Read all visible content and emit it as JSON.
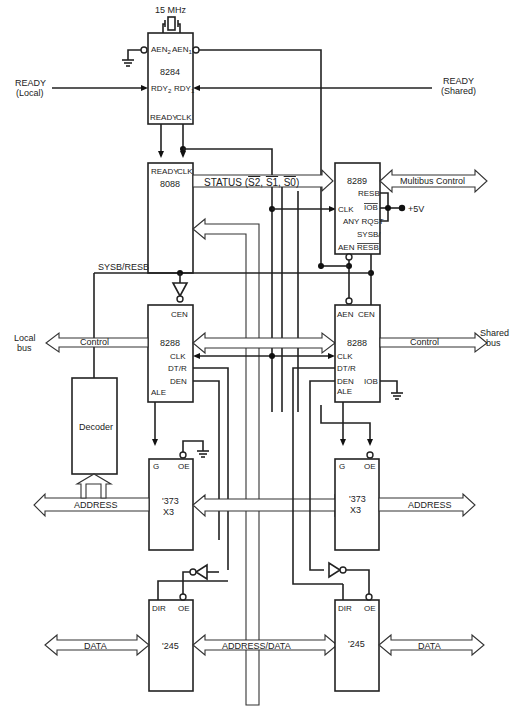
{
  "diagram": {
    "type": "block diagram"
  },
  "clock": {
    "crystal_label": "15 MHz",
    "chip": "8284",
    "pins": {
      "aen2": "AEN",
      "aen2_sub": "2",
      "aen1": "AEN",
      "aen1_sub": "1",
      "rdy2": "RDY",
      "rdy2_sub": "2",
      "rdy1": "RDY",
      "rdy1_sub": "1",
      "ready": "READY",
      "clk": "CLK"
    }
  },
  "signals": {
    "ready_local_1": "READY",
    "ready_local_2": "(Local)",
    "ready_shared_1": "READY",
    "ready_shared_2": "(Shared)",
    "status": "STATUS (S2, S1, S0)",
    "sysb_resb": "SYSB/RESB",
    "plus5v": "+5V"
  },
  "cpu": {
    "chip": "8088",
    "pins": {
      "ready": "READY",
      "clk": "CLK"
    }
  },
  "arbiter": {
    "chip": "8289",
    "pins": {
      "resb": "RESB",
      "clk": "CLK",
      "iob": "IOB",
      "any_rqst": "ANY RQST",
      "sysb": "SYSB/",
      "aen": "AEN",
      "resb_bar": "RESB"
    },
    "bus_label": "Multibus Control"
  },
  "local_bus_controller": {
    "chip": "8288",
    "pins": {
      "cen": "CEN",
      "clk": "CLK",
      "dtr": "DT/R",
      "den": "DEN",
      "ale": "ALE"
    },
    "control_label": "Control",
    "bus_label_1": "Local",
    "bus_label_2": "bus"
  },
  "shared_bus_controller": {
    "chip": "8288",
    "pins": {
      "aen": "AEN",
      "cen": "CEN",
      "clk": "CLK",
      "dtr": "DT/R",
      "den": "DEN",
      "ale": "ALE",
      "iob": "IOB"
    },
    "control_label": "Control",
    "bus_label_1": "Shared",
    "bus_label_2": "bus"
  },
  "decoder": {
    "label": "Decoder"
  },
  "local_latch": {
    "chip": "'373",
    "count": "X3",
    "pins": {
      "g": "G",
      "oe": "OE"
    },
    "bus_label": "ADDRESS"
  },
  "shared_latch": {
    "chip": "'373",
    "count": "X3",
    "pins": {
      "g": "G",
      "oe": "OE"
    },
    "bus_label": "ADDRESS"
  },
  "local_transceiver": {
    "chip": "'245",
    "pins": {
      "dir": "DIR",
      "oe": "OE"
    },
    "bus_label": "DATA"
  },
  "shared_transceiver": {
    "chip": "'245",
    "pins": {
      "dir": "DIR",
      "oe": "OE"
    },
    "bus_label": "DATA"
  },
  "internal_bus": {
    "label": "ADDRESS/DATA"
  },
  "icons": [
    "ground-icon",
    "inverter-icon",
    "crystal-icon",
    "junction-dot-icon"
  ]
}
